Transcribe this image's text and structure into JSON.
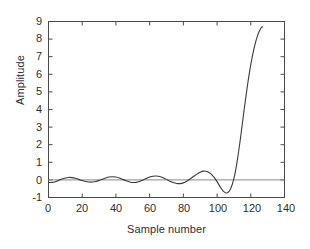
{
  "chart_data": {
    "type": "line",
    "title": "",
    "xlabel": "Sample number",
    "ylabel": "Amplitude",
    "xlim": [
      0,
      140
    ],
    "ylim": [
      -1,
      9
    ],
    "xticks": [
      0,
      20,
      40,
      60,
      80,
      100,
      120,
      140
    ],
    "yticks": [
      -1,
      0,
      1,
      2,
      3,
      4,
      5,
      6,
      7,
      8,
      9
    ],
    "grid": false,
    "legend": null,
    "line_color": "#3a3a3a",
    "axis_color": "#4a4a4a",
    "background": "#ffffff",
    "zero_reference_line": true,
    "series": [
      {
        "name": "impulse response",
        "description": "Growing oscillation that diverges into a steep exponential rise near sample 110",
        "x": [
          0,
          2,
          4,
          6,
          8,
          10,
          12,
          14,
          16,
          18,
          20,
          22,
          24,
          26,
          28,
          30,
          32,
          34,
          36,
          38,
          40,
          42,
          44,
          46,
          48,
          50,
          52,
          54,
          56,
          58,
          60,
          62,
          64,
          66,
          68,
          70,
          72,
          74,
          76,
          78,
          80,
          82,
          84,
          86,
          88,
          90,
          92,
          94,
          96,
          98,
          100,
          102,
          104,
          106,
          108,
          110,
          112,
          114,
          116,
          118,
          120,
          122,
          124,
          126,
          127
        ],
        "y": [
          -0.15,
          -0.14,
          -0.1,
          -0.03,
          0.05,
          0.11,
          0.14,
          0.13,
          0.09,
          0.03,
          -0.04,
          -0.09,
          -0.12,
          -0.12,
          -0.09,
          -0.03,
          0.04,
          0.11,
          0.16,
          0.18,
          0.16,
          0.11,
          0.03,
          -0.05,
          -0.11,
          -0.15,
          -0.14,
          -0.09,
          -0.01,
          0.08,
          0.16,
          0.21,
          0.22,
          0.19,
          0.12,
          0.03,
          -0.07,
          -0.15,
          -0.2,
          -0.21,
          -0.17,
          -0.08,
          0.05,
          0.19,
          0.33,
          0.44,
          0.5,
          0.48,
          0.37,
          0.17,
          -0.1,
          -0.42,
          -0.67,
          -0.74,
          -0.52,
          0.08,
          1.1,
          2.45,
          3.95,
          5.35,
          6.55,
          7.5,
          8.2,
          8.62,
          8.7
        ]
      }
    ],
    "annotations": {
      "oscillation_peaks_x": [
        12,
        39,
        65,
        91
      ],
      "oscillation_peaks_y": [
        0.14,
        0.18,
        0.22,
        0.5
      ],
      "minimum_x": 105,
      "minimum_y": -0.74,
      "zero_crossing_before_rise_x": 110,
      "final_x": 127,
      "final_y": 8.7
    }
  },
  "axes": {
    "y_label": "Amplitude",
    "x_label": "Sample number",
    "y_tick_labels": [
      "9",
      "8",
      "7",
      "6",
      "5",
      "4",
      "3",
      "2",
      "1",
      "0",
      "-1"
    ],
    "x_tick_labels": [
      "0",
      "20",
      "40",
      "60",
      "80",
      "100",
      "120",
      "140"
    ]
  }
}
